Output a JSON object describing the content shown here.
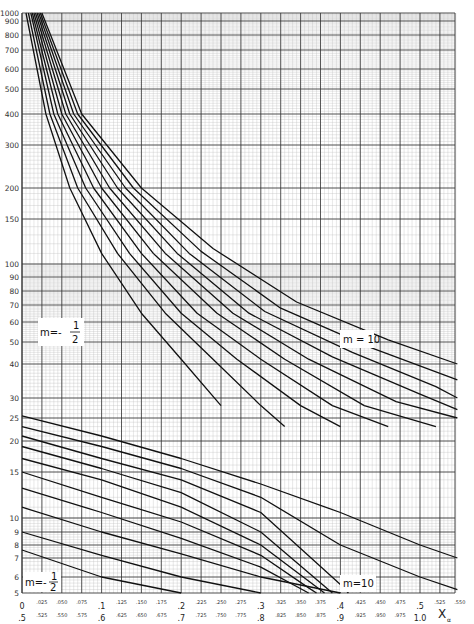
{
  "chart_data": {
    "type": "line",
    "title": "",
    "xlabel": "Xα",
    "ylabel": "",
    "y_scale": "log",
    "ylim": [
      5,
      1000
    ],
    "xlim": [
      0,
      0.55
    ],
    "grid": true,
    "y_ticks": [
      1000,
      900,
      800,
      700,
      600,
      500,
      400,
      300,
      200,
      150,
      100,
      90,
      80,
      70,
      60,
      50,
      40,
      30,
      25,
      20,
      15,
      10,
      9,
      8,
      7,
      6,
      5
    ],
    "x_ticks_row1": {
      "major": [
        "0",
        ".1",
        ".2",
        ".3",
        ".4",
        ".5"
      ],
      "minor": [
        ".025",
        ".050",
        ".075",
        ".125",
        ".150",
        ".175",
        ".225",
        ".250",
        ".275",
        ".325",
        ".350",
        ".375",
        ".425",
        ".450",
        ".475",
        ".525",
        ".550"
      ]
    },
    "x_ticks_row2": {
      "major": [
        ".5",
        ".6",
        ".7",
        ".8",
        ".9",
        "1.0"
      ],
      "minor": [
        ".525",
        ".550",
        ".575",
        ".625",
        ".650",
        ".675",
        ".725",
        ".750",
        ".775",
        ".825",
        ".850",
        ".875",
        ".925",
        ".950",
        ".975"
      ]
    },
    "annotations": [
      {
        "text": "m=-1/2",
        "family": "upper",
        "position": "left"
      },
      {
        "text": "m = 10",
        "family": "upper",
        "position": "right"
      },
      {
        "text": "m=-1/2",
        "family": "lower",
        "position": "bottom-left"
      },
      {
        "text": "m=10",
        "family": "lower",
        "position": "bottom-right"
      }
    ],
    "series_upper": [
      {
        "name": "upper-1 (m=-1/2)",
        "points": [
          [
            0.005,
            1000
          ],
          [
            0.03,
            400
          ],
          [
            0.06,
            200
          ],
          [
            0.1,
            110
          ],
          [
            0.15,
            65
          ],
          [
            0.2,
            42
          ],
          [
            0.25,
            28
          ]
        ]
      },
      {
        "name": "upper-2",
        "points": [
          [
            0.008,
            1000
          ],
          [
            0.035,
            400
          ],
          [
            0.07,
            200
          ],
          [
            0.12,
            110
          ],
          [
            0.18,
            65
          ],
          [
            0.24,
            42
          ],
          [
            0.3,
            28
          ],
          [
            0.33,
            23
          ]
        ]
      },
      {
        "name": "upper-3",
        "points": [
          [
            0.011,
            1000
          ],
          [
            0.04,
            400
          ],
          [
            0.08,
            200
          ],
          [
            0.135,
            110
          ],
          [
            0.2,
            65
          ],
          [
            0.27,
            42
          ],
          [
            0.35,
            28
          ],
          [
            0.4,
            23
          ]
        ]
      },
      {
        "name": "upper-4",
        "points": [
          [
            0.013,
            1000
          ],
          [
            0.045,
            400
          ],
          [
            0.09,
            200
          ],
          [
            0.15,
            110
          ],
          [
            0.22,
            65
          ],
          [
            0.3,
            42
          ],
          [
            0.39,
            28
          ],
          [
            0.46,
            23
          ]
        ]
      },
      {
        "name": "upper-5",
        "points": [
          [
            0.015,
            1000
          ],
          [
            0.05,
            400
          ],
          [
            0.1,
            200
          ],
          [
            0.165,
            110
          ],
          [
            0.245,
            65
          ],
          [
            0.33,
            42
          ],
          [
            0.43,
            28
          ],
          [
            0.52,
            23
          ]
        ]
      },
      {
        "name": "upper-6",
        "points": [
          [
            0.017,
            1000
          ],
          [
            0.055,
            400
          ],
          [
            0.11,
            200
          ],
          [
            0.18,
            110
          ],
          [
            0.265,
            65
          ],
          [
            0.36,
            42
          ],
          [
            0.47,
            29
          ],
          [
            0.547,
            25
          ]
        ]
      },
      {
        "name": "upper-7",
        "points": [
          [
            0.019,
            1000
          ],
          [
            0.06,
            400
          ],
          [
            0.12,
            200
          ],
          [
            0.195,
            110
          ],
          [
            0.285,
            65
          ],
          [
            0.39,
            43
          ],
          [
            0.5,
            31
          ],
          [
            0.547,
            27
          ]
        ]
      },
      {
        "name": "upper-8",
        "points": [
          [
            0.021,
            1000
          ],
          [
            0.065,
            400
          ],
          [
            0.13,
            200
          ],
          [
            0.21,
            110
          ],
          [
            0.305,
            66
          ],
          [
            0.415,
            45
          ],
          [
            0.52,
            33
          ],
          [
            0.547,
            30
          ]
        ]
      },
      {
        "name": "upper-9",
        "points": [
          [
            0.023,
            1000
          ],
          [
            0.07,
            400
          ],
          [
            0.14,
            200
          ],
          [
            0.225,
            112
          ],
          [
            0.325,
            68
          ],
          [
            0.44,
            47
          ],
          [
            0.547,
            35
          ]
        ]
      },
      {
        "name": "upper-10 (m=10)",
        "points": [
          [
            0.025,
            1000
          ],
          [
            0.075,
            400
          ],
          [
            0.15,
            200
          ],
          [
            0.24,
            115
          ],
          [
            0.345,
            72
          ],
          [
            0.46,
            51
          ],
          [
            0.547,
            40
          ]
        ]
      }
    ],
    "series_lower": [
      {
        "name": "lower-1 (m=-1/2)",
        "points": [
          [
            0,
            7.6
          ],
          [
            0.1,
            6
          ],
          [
            0.2,
            5
          ]
        ]
      },
      {
        "name": "lower-2",
        "points": [
          [
            0,
            9
          ],
          [
            0.1,
            7.2
          ],
          [
            0.2,
            6
          ],
          [
            0.3,
            5
          ]
        ]
      },
      {
        "name": "lower-3",
        "points": [
          [
            0,
            11
          ],
          [
            0.1,
            9
          ],
          [
            0.2,
            7.3
          ],
          [
            0.3,
            6
          ],
          [
            0.4,
            5
          ]
        ]
      },
      {
        "name": "lower-4",
        "points": [
          [
            0,
            13
          ],
          [
            0.1,
            10.5
          ],
          [
            0.2,
            8.5
          ],
          [
            0.3,
            6.5
          ],
          [
            0.36,
            5
          ]
        ]
      },
      {
        "name": "lower-5",
        "points": [
          [
            0,
            15
          ],
          [
            0.1,
            12
          ],
          [
            0.2,
            9.7
          ],
          [
            0.3,
            7.2
          ],
          [
            0.36,
            5.3
          ],
          [
            0.37,
            5
          ]
        ]
      },
      {
        "name": "lower-6",
        "points": [
          [
            0,
            17
          ],
          [
            0.1,
            14
          ],
          [
            0.2,
            11
          ],
          [
            0.3,
            8
          ],
          [
            0.38,
            5
          ]
        ]
      },
      {
        "name": "lower-7",
        "points": [
          [
            0,
            19
          ],
          [
            0.1,
            15.5
          ],
          [
            0.2,
            12.5
          ],
          [
            0.3,
            9
          ],
          [
            0.39,
            5
          ]
        ]
      },
      {
        "name": "lower-8",
        "points": [
          [
            0,
            21
          ],
          [
            0.1,
            17
          ],
          [
            0.2,
            14
          ],
          [
            0.3,
            10.5
          ],
          [
            0.4,
            5.5
          ],
          [
            0.41,
            5
          ]
        ]
      },
      {
        "name": "lower-9",
        "points": [
          [
            0,
            23
          ],
          [
            0.1,
            19
          ],
          [
            0.2,
            15.5
          ],
          [
            0.3,
            12
          ],
          [
            0.4,
            8
          ],
          [
            0.5,
            6
          ],
          [
            0.547,
            5.2
          ]
        ]
      },
      {
        "name": "lower-10 (m=10)",
        "points": [
          [
            0,
            25.5
          ],
          [
            0.1,
            21
          ],
          [
            0.2,
            17
          ],
          [
            0.3,
            13.5
          ],
          [
            0.4,
            10.5
          ],
          [
            0.5,
            8
          ],
          [
            0.547,
            7
          ]
        ]
      }
    ]
  },
  "labels": {
    "upper_left": {
      "prefix": "m=-",
      "num": "1",
      "den": "2"
    },
    "upper_right": "m = 10",
    "lower_left": {
      "prefix": "m=-",
      "num": "1",
      "den": "2"
    },
    "lower_right": "m=10",
    "x_axis": "X",
    "x_axis_sub": "α"
  }
}
